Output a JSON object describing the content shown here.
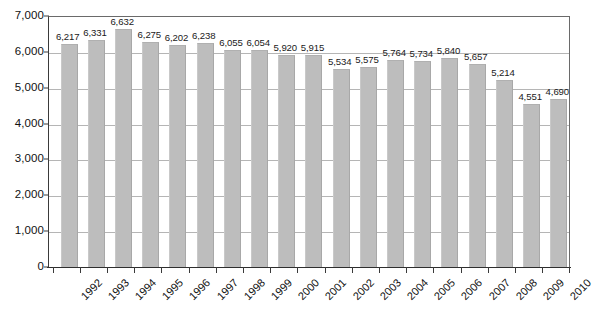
{
  "chart_data": {
    "type": "bar",
    "title": "",
    "subtitle": "",
    "xlabel": "",
    "ylabel": "",
    "categories": [
      "1992",
      "1993",
      "1994",
      "1995",
      "1996",
      "1997",
      "1998",
      "1999",
      "2000",
      "2001",
      "2002",
      "2003",
      "2004",
      "2005",
      "2006",
      "2007",
      "2008",
      "2009",
      "2010"
    ],
    "values": [
      6217,
      6331,
      6632,
      6275,
      6202,
      6238,
      6055,
      6054,
      5920,
      5915,
      5534,
      5575,
      5764,
      5734,
      5840,
      5657,
      5214,
      4551,
      4690
    ],
    "value_labels": [
      "6,217",
      "6,331",
      "6,632",
      "6,275",
      "6,202",
      "6,238",
      "6,055",
      "6,054",
      "5,920",
      "5,915",
      "5,534",
      "5,575",
      "5,764",
      "5,734",
      "5,840",
      "5,657",
      "5,214",
      "4,551",
      "4,690"
    ],
    "ylim": [
      0,
      7000
    ],
    "ytick_values": [
      0,
      1000,
      2000,
      3000,
      4000,
      5000,
      6000,
      7000
    ],
    "ytick_labels": [
      "0",
      "1,000",
      "2,000",
      "3,000",
      "4,000",
      "5,000",
      "6,000",
      "7,000"
    ],
    "grid": true,
    "grid_axis": "y",
    "legend": false,
    "legend_position": "none",
    "series": [
      {
        "name": "",
        "values": [
          6217,
          6331,
          6632,
          6275,
          6202,
          6238,
          6055,
          6054,
          5920,
          5915,
          5534,
          5575,
          5764,
          5734,
          5840,
          5657,
          5214,
          4551,
          4690
        ],
        "color": "#bdbdbd"
      }
    ],
    "colors": {
      "bar_fill": "#bdbdbd",
      "gridline": "#b5b5b5",
      "axis": "#2e2e2e",
      "plot_border": "#6a6a6a",
      "background": "#ffffff",
      "text": "#1a1a1a"
    }
  }
}
